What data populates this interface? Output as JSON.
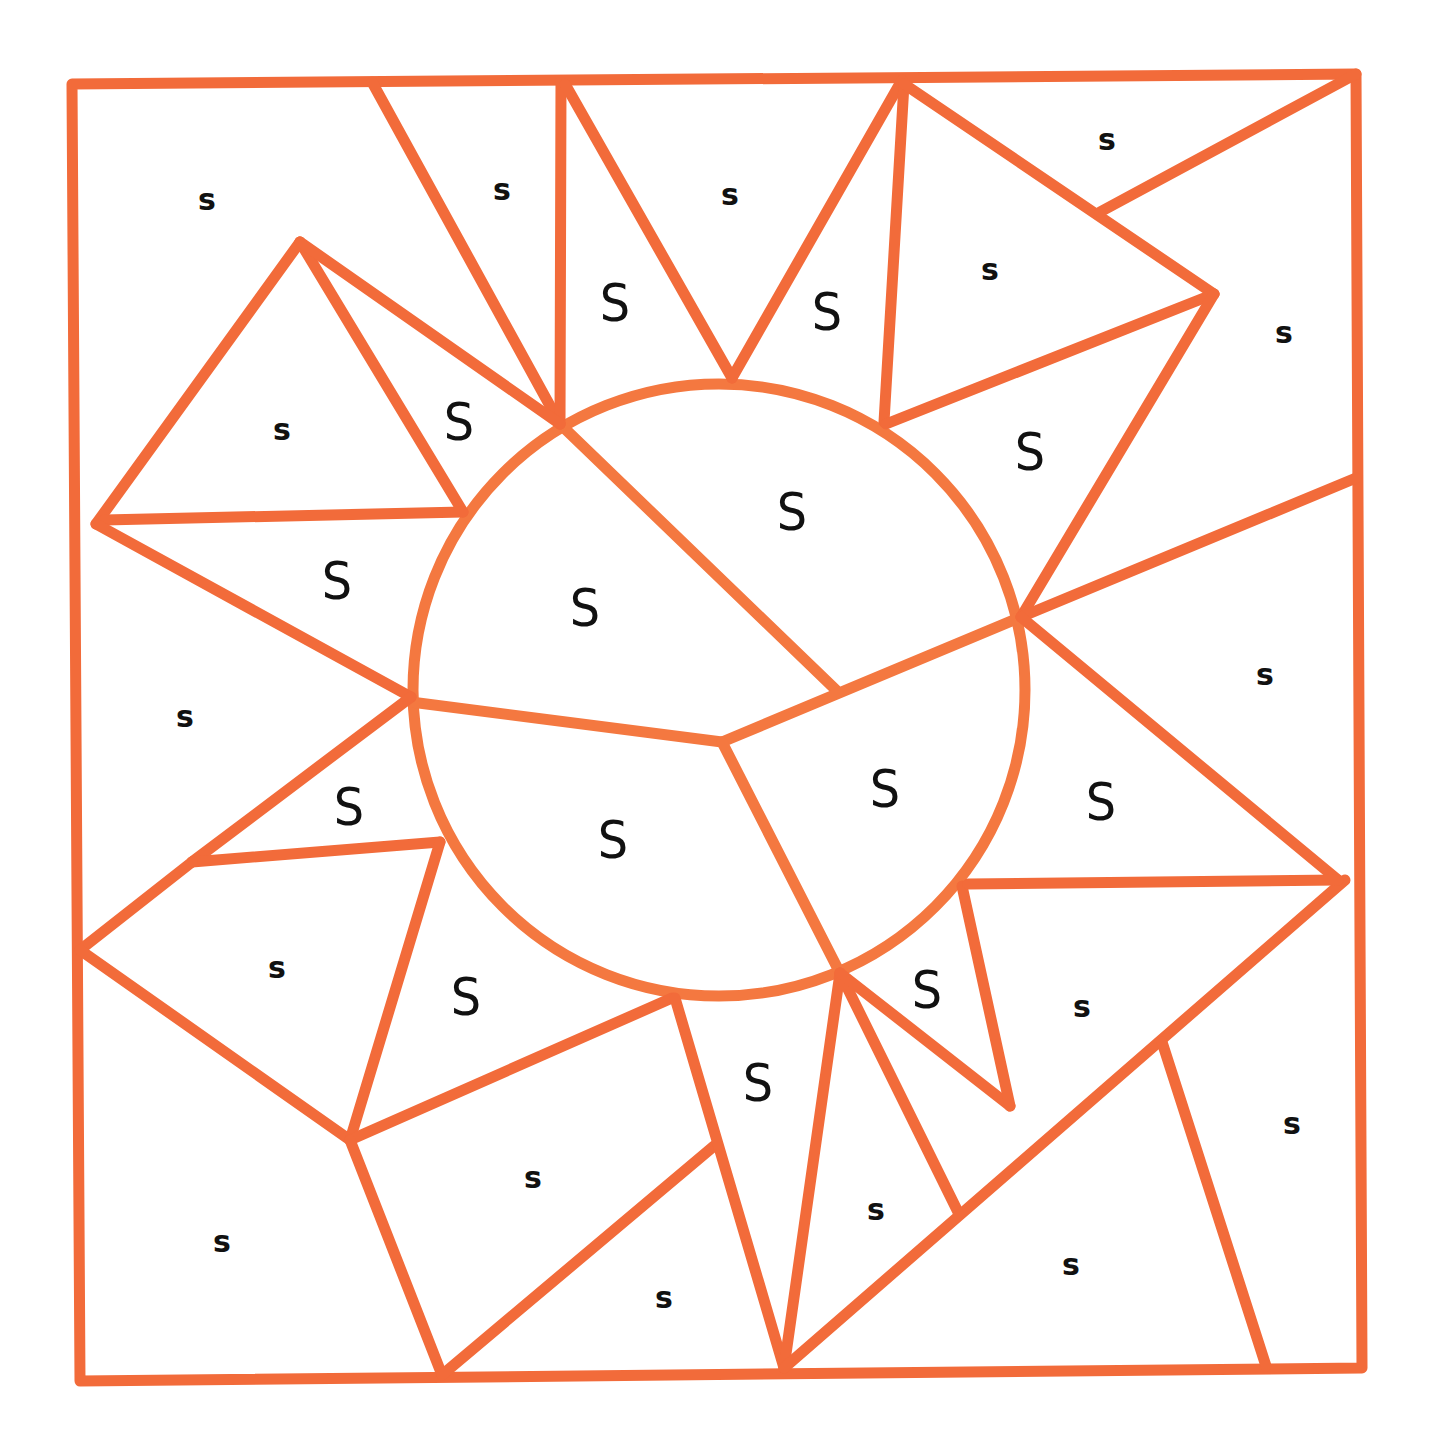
{
  "puzzle": {
    "stroke_color": "#f26b3a",
    "background": "#ffffff",
    "text_color": "#111111"
  },
  "labels": [
    {
      "text": "s",
      "type": "lower",
      "x": 207,
      "y": 200
    },
    {
      "text": "s",
      "type": "lower",
      "x": 502,
      "y": 190
    },
    {
      "text": "s",
      "type": "lower",
      "x": 730,
      "y": 195
    },
    {
      "text": "s",
      "type": "lower",
      "x": 1107,
      "y": 140
    },
    {
      "text": "s",
      "type": "lower",
      "x": 990,
      "y": 270
    },
    {
      "text": "s",
      "type": "lower",
      "x": 1284,
      "y": 333
    },
    {
      "text": "s",
      "type": "lower",
      "x": 282,
      "y": 430
    },
    {
      "text": "s",
      "type": "lower",
      "x": 185,
      "y": 717
    },
    {
      "text": "s",
      "type": "lower",
      "x": 1265,
      "y": 675
    },
    {
      "text": "s",
      "type": "lower",
      "x": 277,
      "y": 968
    },
    {
      "text": "s",
      "type": "lower",
      "x": 1082,
      "y": 1007
    },
    {
      "text": "s",
      "type": "lower",
      "x": 1292,
      "y": 1124
    },
    {
      "text": "s",
      "type": "lower",
      "x": 533,
      "y": 1178
    },
    {
      "text": "s",
      "type": "lower",
      "x": 876,
      "y": 1210
    },
    {
      "text": "s",
      "type": "lower",
      "x": 222,
      "y": 1242
    },
    {
      "text": "s",
      "type": "lower",
      "x": 1071,
      "y": 1265
    },
    {
      "text": "s",
      "type": "lower",
      "x": 664,
      "y": 1298
    },
    {
      "text": "S",
      "type": "upper",
      "x": 615,
      "y": 303
    },
    {
      "text": "S",
      "type": "upper",
      "x": 827,
      "y": 312
    },
    {
      "text": "S",
      "type": "upper",
      "x": 459,
      "y": 422
    },
    {
      "text": "S",
      "type": "upper",
      "x": 1030,
      "y": 452
    },
    {
      "text": "S",
      "type": "upper",
      "x": 792,
      "y": 512
    },
    {
      "text": "S",
      "type": "upper",
      "x": 337,
      "y": 581
    },
    {
      "text": "S",
      "type": "upper",
      "x": 585,
      "y": 608
    },
    {
      "text": "S",
      "type": "upper",
      "x": 349,
      "y": 807
    },
    {
      "text": "S",
      "type": "upper",
      "x": 885,
      "y": 789
    },
    {
      "text": "S",
      "type": "upper",
      "x": 1101,
      "y": 802
    },
    {
      "text": "S",
      "type": "upper",
      "x": 613,
      "y": 840
    },
    {
      "text": "S",
      "type": "upper",
      "x": 927,
      "y": 990
    },
    {
      "text": "S",
      "type": "upper",
      "x": 466,
      "y": 997
    },
    {
      "text": "S",
      "type": "upper",
      "x": 758,
      "y": 1083
    }
  ]
}
